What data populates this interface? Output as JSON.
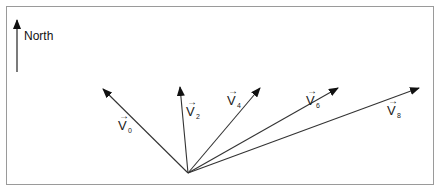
{
  "diagram": {
    "compass": {
      "label": "North",
      "direction": "up"
    },
    "vectors": [
      {
        "name": "V",
        "subscript": "0"
      },
      {
        "name": "V",
        "subscript": "2"
      },
      {
        "name": "V",
        "subscript": "4"
      },
      {
        "name": "V",
        "subscript": "6"
      },
      {
        "name": "V",
        "subscript": "8"
      }
    ],
    "colors": {
      "line": "#333333",
      "frame": "#9a9a9a"
    }
  }
}
